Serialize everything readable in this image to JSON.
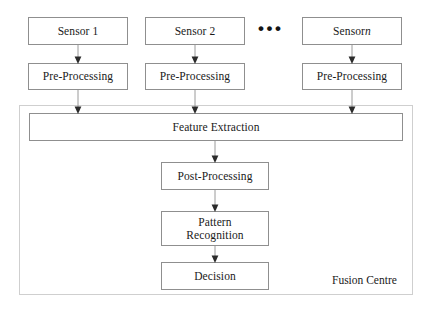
{
  "diagram": {
    "canvas": {
      "width": 430,
      "height": 316
    },
    "colors": {
      "box_border": "#8f8f8f",
      "container_border": "#cfcfcf",
      "connector": "#9a9a9a",
      "arrowhead": "#2b2b2b",
      "text": "#1a1a1a",
      "background": "#ffffff"
    },
    "ellipsis": "•••",
    "fusion_centre_label": "Fusion Centre",
    "sensors": [
      {
        "label": "Sensor 1",
        "preprocessing": "Pre-Processing"
      },
      {
        "label": "Sensor 2",
        "preprocessing": "Pre-Processing"
      },
      {
        "label_prefix": "Sensor ",
        "label_italic": "n",
        "preprocessing": "Pre-Processing"
      }
    ],
    "fusion_stages": [
      {
        "label": "Feature Extraction"
      },
      {
        "label": "Post-Processing"
      },
      {
        "label": "Pattern\nRecognition"
      },
      {
        "label": "Decision"
      }
    ]
  }
}
